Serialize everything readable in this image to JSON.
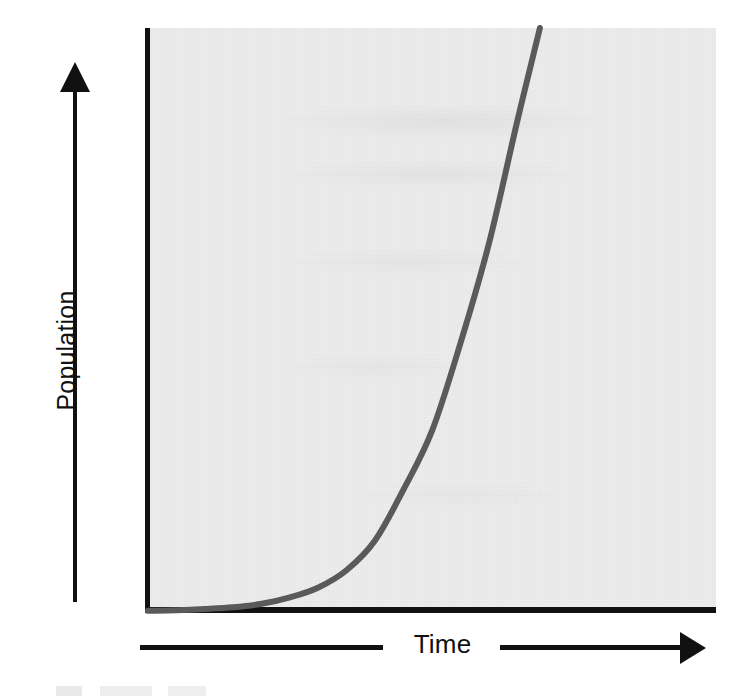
{
  "figure": {
    "kind": "line-chart",
    "background_color": "#ffffff",
    "plot_background_color": "#ededed",
    "axis_color": "#111111",
    "curve_color": "#5a5a5a"
  },
  "axes": {
    "y_title": "Population",
    "x_title": "Time",
    "y_arrow_icon": "up-arrow-icon",
    "x_arrow_icon": "right-arrow-icon"
  },
  "chart_data": {
    "type": "line",
    "title": "",
    "subtitle": "",
    "xlabel": "Time",
    "ylabel": "Population",
    "grid": false,
    "legend": null,
    "legend_position": "none",
    "xlim": [
      0,
      10
    ],
    "ylim": [
      0,
      10
    ],
    "x_tick_labels": [],
    "y_tick_labels": [],
    "annotations": [],
    "series": [
      {
        "name": "Exponential growth",
        "color": "#5a5a5a",
        "line_width": 6,
        "x": [
          0.0,
          0.5,
          1.0,
          1.5,
          2.0,
          2.5,
          3.0,
          3.5,
          4.0,
          4.5,
          5.0,
          5.5,
          6.0,
          6.5,
          6.9
        ],
        "y": [
          0.02,
          0.03,
          0.05,
          0.08,
          0.14,
          0.25,
          0.42,
          0.72,
          1.23,
          2.1,
          3.1,
          4.6,
          6.3,
          8.4,
          10.0
        ]
      }
    ]
  }
}
